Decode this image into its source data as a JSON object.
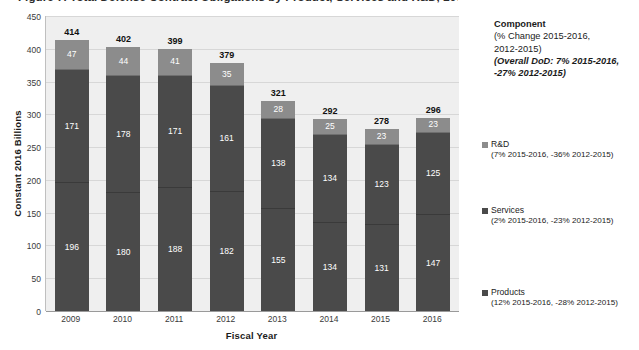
{
  "title": "Figure 7. Total Defense Contract Obligations by Product, Services and R&D, 2009 - 2016",
  "axes": {
    "ylabel": "Constant 2016 Billions",
    "xlabel": "Fiscal Year",
    "yticks": [
      "450",
      "400",
      "350",
      "300",
      "250",
      "200",
      "150",
      "100",
      "50",
      "0"
    ],
    "ylim_min": 0,
    "ylim_max": 450
  },
  "legend": {
    "heading": "Component",
    "sub_line1": "(% Change 2015-2016,",
    "sub_line2": "2012-2015)",
    "italic_line1": "(Overall DoD: 7% 2015-2016,",
    "italic_line2": "-27% 2012-2015)",
    "entries": [
      {
        "name": "R&D",
        "pct": "(7% 2015-2016, -36% 2012-2015)",
        "color": "#8c8c8c"
      },
      {
        "name": "Services",
        "pct": "(2% 2015-2016, -23% 2012-2015)",
        "color": "#4a4a4a"
      },
      {
        "name": "Products",
        "pct": "(12% 2015-2016, -28% 2012-2015)",
        "color": "#4a4a4a"
      }
    ]
  },
  "chart_data": {
    "type": "bar",
    "stacked": true,
    "title": "Figure 7. Total Defense Contract Obligations by Product, Services and R&D, 2009 - 2016",
    "xlabel": "Fiscal Year",
    "ylabel": "Constant 2016 Billions",
    "ylim": [
      0,
      450
    ],
    "ytick_step": 50,
    "grid": true,
    "legend_position": "right",
    "categories": [
      "2009",
      "2010",
      "2011",
      "2012",
      "2013",
      "2014",
      "2015",
      "2016"
    ],
    "series": [
      {
        "name": "Products",
        "color": "#4a4a4a",
        "values": [
          196,
          180,
          188,
          182,
          155,
          134,
          131,
          147
        ]
      },
      {
        "name": "Services",
        "color": "#4a4a4a",
        "values": [
          171,
          178,
          171,
          161,
          138,
          134,
          123,
          125
        ]
      },
      {
        "name": "R&D",
        "color": "#8c8c8c",
        "values": [
          47,
          44,
          41,
          35,
          28,
          25,
          23,
          23
        ]
      }
    ],
    "totals": [
      414,
      402,
      399,
      379,
      321,
      292,
      278,
      296
    ],
    "total_labels": [
      "414",
      "402",
      "399",
      "379",
      "321",
      "292",
      "278",
      "296"
    ]
  }
}
